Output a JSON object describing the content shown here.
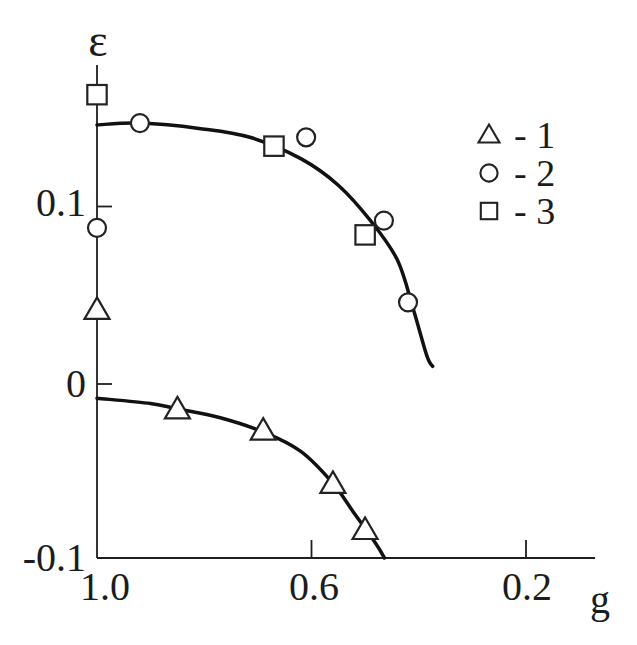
{
  "figure": {
    "background": "#ffffff",
    "ink_color": "#1f1f1f",
    "curve_color": "#111111",
    "marker_fill": "#ffffff"
  },
  "chart_data": {
    "type": "scatter",
    "title": "",
    "xlabel": "g",
    "ylabel": "ε",
    "grid": false,
    "x_axis": {
      "reversed": true,
      "range": [
        1.0,
        0.07
      ],
      "ticks": [
        {
          "value": 1.0,
          "label": "1.0",
          "tick": false
        },
        {
          "value": 0.6,
          "label": "0.6",
          "tick": true
        },
        {
          "value": 0.2,
          "label": "0.2",
          "tick": true
        }
      ]
    },
    "y_axis": {
      "range": [
        -0.1,
        0.18
      ],
      "ticks": [
        {
          "value": 0.1,
          "label": "0.1",
          "tick": true
        },
        {
          "value": 0,
          "label": "0",
          "tick": true
        },
        {
          "value": -0.1,
          "label": "-0.1",
          "tick": false
        }
      ]
    },
    "legend": {
      "position": "upper right",
      "items": [
        {
          "marker": "triangle",
          "label": "- 1"
        },
        {
          "marker": "circle",
          "label": "- 2"
        },
        {
          "marker": "square",
          "label": "- 3"
        }
      ]
    },
    "series": [
      {
        "name": "1",
        "marker": "triangle",
        "points": [
          [
            1.0,
            0.042
          ],
          [
            0.85,
            -0.014
          ],
          [
            0.69,
            -0.026
          ],
          [
            0.56,
            -0.056
          ],
          [
            0.5,
            -0.082
          ]
        ]
      },
      {
        "name": "2",
        "marker": "circle",
        "points": [
          [
            1.0,
            0.088
          ],
          [
            0.92,
            0.147
          ],
          [
            0.61,
            0.139
          ],
          [
            0.465,
            0.092
          ],
          [
            0.42,
            0.046
          ]
        ]
      },
      {
        "name": "3",
        "marker": "square",
        "points": [
          [
            1.0,
            0.163
          ],
          [
            0.67,
            0.134
          ],
          [
            0.5,
            0.084
          ]
        ]
      }
    ],
    "fit_curves": [
      {
        "name": "upper",
        "points": [
          [
            1.0,
            0.146
          ],
          [
            0.92,
            0.147
          ],
          [
            0.81,
            0.144
          ],
          [
            0.715,
            0.139
          ],
          [
            0.62,
            0.127
          ],
          [
            0.55,
            0.112
          ],
          [
            0.49,
            0.092
          ],
          [
            0.44,
            0.07
          ],
          [
            0.41,
            0.042
          ],
          [
            0.385,
            0.016
          ],
          [
            0.374,
            0.01
          ]
        ]
      },
      {
        "name": "lower",
        "points": [
          [
            1.0,
            -0.008
          ],
          [
            0.9,
            -0.011
          ],
          [
            0.85,
            -0.014
          ],
          [
            0.77,
            -0.019
          ],
          [
            0.69,
            -0.027
          ],
          [
            0.62,
            -0.038
          ],
          [
            0.56,
            -0.056
          ],
          [
            0.52,
            -0.073
          ],
          [
            0.48,
            -0.09
          ],
          [
            0.464,
            -0.098
          ]
        ]
      }
    ]
  }
}
